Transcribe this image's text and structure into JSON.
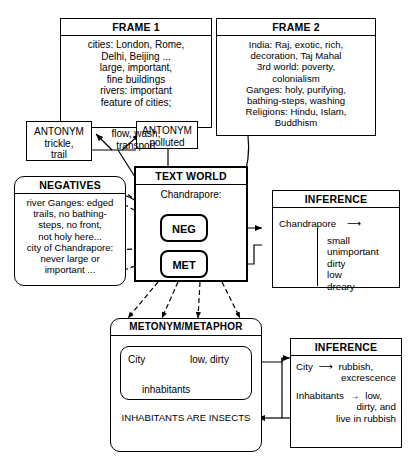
{
  "diagram": {
    "frames": [
      {
        "header": "FRAME 1",
        "lines": [
          "cities: London, Rome,",
          "Delhi, Beijing ...",
          "large, important,",
          "fine buildings",
          "rivers: important",
          "feature of cities;",
          "flow, wash,",
          "transport"
        ]
      },
      {
        "header": "FRAME 2",
        "lines": [
          "India: Raj, exotic, rich,",
          "decoration, Taj Mahal",
          "3rd world: poverty,",
          "colonialism",
          "Ganges: holy, purifying,",
          "bathing-steps, washing",
          "Religions: Hindu, Islam,",
          "Buddhism"
        ]
      }
    ],
    "antonyms": [
      {
        "header": "ANTONYM",
        "lines": [
          "trickle,",
          "trail"
        ]
      },
      {
        "header": "ANTONYM",
        "lines": [
          "polluted"
        ]
      }
    ],
    "negatives": {
      "header": "NEGATIVES",
      "lines": [
        "river Ganges: edged",
        "trails, no bathing-",
        "steps, no front,",
        "not holy here...",
        "city of Chandrapore:",
        "never large or",
        "important ..."
      ]
    },
    "text_world": {
      "header": "TEXT WORLD",
      "subject": "Chandrapore:",
      "nodes": [
        {
          "label": "NEG"
        },
        {
          "label": "MET"
        }
      ]
    },
    "inference_top": {
      "header": "INFERENCE",
      "subject": "Chandrapore",
      "arrow": "⟶",
      "items": [
        "small",
        "unimportant",
        "dirty",
        "low",
        "dreary"
      ]
    },
    "metonym": {
      "header": "METONYM/METAPHOR",
      "mapping": {
        "source": "City",
        "arrow": "⟶",
        "target": "low, dirty",
        "down_left": "↓",
        "down_right": "↓",
        "bottom": "inhabitants"
      },
      "statement": "INHABITANTS ARE INSECTS"
    },
    "inference_bottom": {
      "header": "INFERENCE",
      "rows": [
        {
          "subject": "City",
          "arrow": "⟶",
          "lines": [
            "rubbish,",
            "excrescence"
          ]
        },
        {
          "subject": "Inhabitants",
          "arrow": "→",
          "lines": [
            "low,",
            "dirty, and",
            "live in rubbish"
          ]
        }
      ]
    },
    "colors": {
      "ink": "#000000",
      "paper": "#ffffff"
    }
  }
}
